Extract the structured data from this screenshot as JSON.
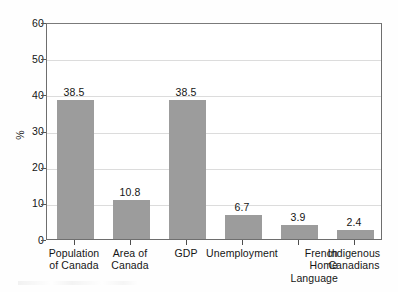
{
  "chart_data": {
    "type": "bar",
    "title": "",
    "subtitle": "",
    "xlabel": "",
    "ylabel": "%",
    "ylim": [
      0,
      60
    ],
    "ytick_values": [
      60,
      50,
      40,
      30,
      20,
      10,
      0
    ],
    "ytick_labels": [
      "60",
      "50",
      "40",
      "30",
      "20",
      "10",
      "0"
    ],
    "grid": true,
    "grid_axis": "y",
    "legend": false,
    "legend_position": "none",
    "bar_color": "#9c9c9c",
    "frame_color": "#6e6e6e",
    "grid_color": "#dcdcdc",
    "categories": [
      "Population of Canada",
      "Area of Canada",
      "GDP",
      "Unemployment",
      "French Home Language",
      "Indigenous Canadians"
    ],
    "category_lines": [
      [
        "Population",
        "of Canada"
      ],
      [
        "Area of",
        "Canada"
      ],
      [
        "GDP"
      ],
      [
        "Unemployment"
      ],
      [
        "French",
        "Home",
        "Language"
      ],
      [
        "Indigenous",
        "Canadians"
      ]
    ],
    "values": [
      38.5,
      10.8,
      38.5,
      6.7,
      3.9,
      2.4
    ],
    "value_labels": [
      "38.5",
      "10.8",
      "38.5",
      "6.7",
      "3.9",
      "2.4"
    ]
  }
}
